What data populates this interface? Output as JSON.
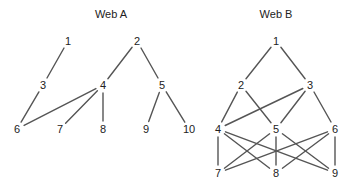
{
  "diagram": {
    "type": "food-web-graphs",
    "colors": {
      "background": "#ffffff",
      "text": "#222222",
      "edge": "#555555"
    },
    "webs": [
      {
        "id": "web-a",
        "title": "Web A",
        "title_pos": [
          111,
          18
        ],
        "nodes": [
          {
            "id": "1",
            "label": "1",
            "x": 68,
            "y": 41
          },
          {
            "id": "2",
            "label": "2",
            "x": 137,
            "y": 41
          },
          {
            "id": "3",
            "label": "3",
            "x": 43,
            "y": 85
          },
          {
            "id": "4",
            "label": "4",
            "x": 103,
            "y": 85
          },
          {
            "id": "5",
            "label": "5",
            "x": 162,
            "y": 85
          },
          {
            "id": "6",
            "label": "6",
            "x": 17,
            "y": 129
          },
          {
            "id": "7",
            "label": "7",
            "x": 60,
            "y": 129
          },
          {
            "id": "8",
            "label": "8",
            "x": 103,
            "y": 129
          },
          {
            "id": "9",
            "label": "9",
            "x": 146,
            "y": 129
          },
          {
            "id": "10",
            "label": "10",
            "x": 189,
            "y": 129
          }
        ],
        "edges": [
          [
            "1",
            "3"
          ],
          [
            "2",
            "4"
          ],
          [
            "2",
            "5"
          ],
          [
            "3",
            "6"
          ],
          [
            "4",
            "6"
          ],
          [
            "4",
            "7"
          ],
          [
            "4",
            "8"
          ],
          [
            "5",
            "9"
          ],
          [
            "5",
            "10"
          ]
        ]
      },
      {
        "id": "web-b",
        "title": "Web B",
        "title_pos": [
          276,
          18
        ],
        "nodes": [
          {
            "id": "1",
            "label": "1",
            "x": 276,
            "y": 41
          },
          {
            "id": "2",
            "label": "2",
            "x": 241,
            "y": 85
          },
          {
            "id": "3",
            "label": "3",
            "x": 310,
            "y": 85
          },
          {
            "id": "4",
            "label": "4",
            "x": 218,
            "y": 129
          },
          {
            "id": "5",
            "label": "5",
            "x": 276,
            "y": 129
          },
          {
            "id": "6",
            "label": "6",
            "x": 335,
            "y": 129
          },
          {
            "id": "7",
            "label": "7",
            "x": 218,
            "y": 173
          },
          {
            "id": "8",
            "label": "8",
            "x": 276,
            "y": 173
          },
          {
            "id": "9",
            "label": "9",
            "x": 335,
            "y": 173
          }
        ],
        "edges": [
          [
            "1",
            "2"
          ],
          [
            "1",
            "3"
          ],
          [
            "2",
            "4"
          ],
          [
            "2",
            "5"
          ],
          [
            "3",
            "4"
          ],
          [
            "3",
            "5"
          ],
          [
            "3",
            "6"
          ],
          [
            "4",
            "7"
          ],
          [
            "4",
            "8"
          ],
          [
            "4",
            "9"
          ],
          [
            "5",
            "7"
          ],
          [
            "5",
            "8"
          ],
          [
            "5",
            "9"
          ],
          [
            "6",
            "7"
          ],
          [
            "6",
            "8"
          ],
          [
            "6",
            "9"
          ]
        ]
      }
    ]
  }
}
